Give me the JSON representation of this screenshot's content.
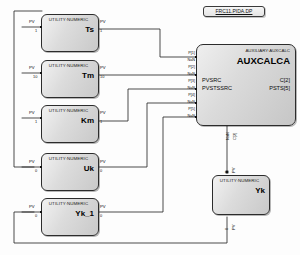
{
  "diagram": {
    "title_tag": "FRC11.PIDA.DP",
    "background_color": "#fdfdfd",
    "block_fill": "#d9d9d9",
    "line_color": "#2c2c2c"
  },
  "utility_blocks": [
    {
      "type_label": "UTILITY:NUMERIC",
      "name": "Ts",
      "input_pin": "PV",
      "input_value": "1",
      "output_pin": "PV",
      "output_value": "1"
    },
    {
      "type_label": "UTILITY:NUMERIC",
      "name": "Tm",
      "input_pin": "PV",
      "input_value": "10",
      "output_pin": "PV",
      "output_value": "10"
    },
    {
      "type_label": "UTILITY:NUMERIC",
      "name": "Km",
      "input_pin": "PV",
      "input_value": "1",
      "output_pin": "PV",
      "output_value": "1"
    },
    {
      "type_label": "UTILITY:NUMERIC",
      "name": "Uk",
      "input_pin": "PV",
      "input_value": "0",
      "output_pin": "PV",
      "output_value": "0"
    },
    {
      "type_label": "UTILITY:NUMERIC",
      "name": "Yk_1",
      "input_pin": "PV",
      "input_value": "0",
      "output_pin": "PV",
      "output_value": "0"
    }
  ],
  "aux_block": {
    "type_label": "AUXILIARY:AUXCALC",
    "name": "AUXCALCA",
    "input_labels": [
      "PVSRC",
      "PVSTSSRC"
    ],
    "output_labels": [
      "C[2]",
      "PSTS[5]"
    ],
    "input_pins": [
      {
        "name": "P[1]",
        "value": "NaN"
      },
      {
        "name": "P[2]",
        "value": "NaN"
      },
      {
        "name": "P[3]",
        "value": "NaN"
      },
      {
        "name": "P[4]",
        "value": "NaN"
      },
      {
        "name": "P[5]",
        "value": "NaN"
      }
    ],
    "bottom_pins": [
      {
        "name": "C[2]",
        "value": "NaN"
      }
    ]
  },
  "yk_block": {
    "type_label": "UTILITY:NUMERIC",
    "name": "Yk",
    "top_pin": {
      "name": "PV",
      "value": "0"
    },
    "bottom_pin": {
      "name": "PV",
      "value": "0"
    }
  }
}
